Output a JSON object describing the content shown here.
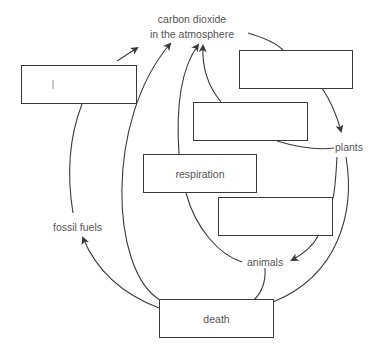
{
  "diagram": {
    "type": "carbon-cycle",
    "labels": {
      "co2_line1": "carbon dioxide",
      "co2_line2": "in the atmosphere",
      "plants": "plants",
      "animals": "animals",
      "fossil_fuels": "fossil fuels"
    },
    "boxes": [
      {
        "id": "box-left",
        "text": ""
      },
      {
        "id": "box-top-right",
        "text": ""
      },
      {
        "id": "box-middle",
        "text": ""
      },
      {
        "id": "box-respiration",
        "text": "respiration"
      },
      {
        "id": "box-right-middle",
        "text": ""
      },
      {
        "id": "box-death",
        "text": "death"
      }
    ],
    "colors": {
      "line": "#3a3a3a",
      "text": "#555555",
      "background": "#ffffff"
    }
  }
}
